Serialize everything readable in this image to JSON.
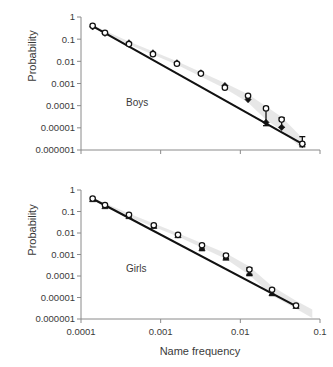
{
  "figure": {
    "x_axis_title": "Name frequency",
    "y_axis_title": "Probability"
  },
  "chart_data": [
    {
      "type": "scatter",
      "panel_id": "boys",
      "title": "",
      "annotation": "Boys",
      "xlabel": "Name frequency",
      "ylabel": "Probability",
      "xscale": "log",
      "yscale": "log",
      "xlim": [
        0.0001,
        0.1
      ],
      "ylim": [
        1e-06,
        1
      ],
      "xticks": [
        0.0001,
        0.001,
        0.01,
        0.1
      ],
      "xtick_labels": [
        "0.0001",
        "0.001",
        "0.01",
        "0.1"
      ],
      "yticks": [
        1,
        0.1,
        0.01,
        0.001,
        0.0001,
        1e-05,
        1e-06
      ],
      "ytick_labels": [
        "1",
        "0.1",
        "0.01",
        "0.001",
        "0.0001",
        "0.00001",
        "0.000001"
      ],
      "grid": false,
      "legend": "none",
      "series": [
        {
          "name": "observed-filled",
          "marker": "filled-diamond",
          "x": [
            0.00014,
            0.0002,
            0.0004,
            0.0008,
            0.0016,
            0.0032,
            0.0064,
            0.0125,
            0.021,
            0.033,
            0.06
          ],
          "y": [
            0.36,
            0.185,
            0.068,
            0.024,
            0.0085,
            0.003,
            0.0008,
            0.00019,
            1.75e-05,
            1.05e-05,
            1.8e-06
          ]
        },
        {
          "name": "predicted-open",
          "marker": "open-circle",
          "x": [
            0.00014,
            0.0002,
            0.0004,
            0.0008,
            0.0016,
            0.0032,
            0.0064,
            0.0125,
            0.021,
            0.033,
            0.06
          ],
          "y": [
            0.4,
            0.195,
            0.06,
            0.021,
            0.0078,
            0.0028,
            0.00065,
            0.00028,
            7.5e-05,
            2.35e-05,
            1.9e-06
          ]
        }
      ],
      "error_bars": [
        {
          "x": 0.021,
          "y": 7.5e-05,
          "lo": 1.25e-05,
          "hi": 9e-05
        },
        {
          "x": 0.033,
          "y": 2.35e-05,
          "lo": 1.05e-05,
          "hi": 2.9e-05
        },
        {
          "x": 0.06,
          "y": 1.9e-06,
          "lo": 1.4e-06,
          "hi": 4e-06
        }
      ],
      "band": {
        "x": [
          0.00014,
          0.0004,
          0.0016,
          0.0064,
          0.0125,
          0.021,
          0.033,
          0.06
        ],
        "lo": [
          0.33,
          0.058,
          0.007,
          0.0006,
          0.00014,
          2.3e-05,
          7.5e-06,
          1.1e-06
        ],
        "hi": [
          0.44,
          0.078,
          0.01,
          0.00105,
          0.00033,
          9.5e-05,
          3.1e-05,
          3.5e-06
        ]
      },
      "fit": {
        "x": [
          0.00014,
          0.06
        ],
        "y": [
          0.385,
          1.9e-06
        ]
      }
    },
    {
      "type": "scatter",
      "panel_id": "girls",
      "title": "",
      "annotation": "Girls",
      "xlabel": "Name frequency",
      "ylabel": "Probability",
      "xscale": "log",
      "yscale": "log",
      "xlim": [
        0.0001,
        0.1
      ],
      "ylim": [
        1e-06,
        1
      ],
      "xticks": [
        0.0001,
        0.001,
        0.01,
        0.1
      ],
      "xtick_labels": [
        "0.0001",
        "0.001",
        "0.01",
        "0.1"
      ],
      "yticks": [
        1,
        0.1,
        0.01,
        0.001,
        0.0001,
        1e-05,
        1e-06
      ],
      "ytick_labels": [
        "1",
        "0.1",
        "0.01",
        "0.001",
        "0.0001",
        "0.00001",
        "0.000001"
      ],
      "grid": false,
      "legend": "none",
      "series": [
        {
          "name": "observed-filled",
          "marker": "filled-triangle",
          "x": [
            0.00014,
            0.0002,
            0.0004,
            0.00082,
            0.00165,
            0.0033,
            0.0066,
            0.013,
            0.025,
            0.05
          ],
          "y": [
            0.37,
            0.175,
            0.06,
            0.021,
            0.0078,
            0.0019,
            0.0007,
            0.00013,
            1.55e-05,
            4e-06
          ]
        },
        {
          "name": "predicted-open",
          "marker": "open-circle",
          "x": [
            0.00014,
            0.0002,
            0.0004,
            0.00082,
            0.00165,
            0.0033,
            0.0066,
            0.013,
            0.025,
            0.05
          ],
          "y": [
            0.4,
            0.2,
            0.07,
            0.023,
            0.0082,
            0.0027,
            0.0009,
            0.0002,
            2.3e-05,
            4.2e-06
          ]
        }
      ],
      "error_bars": [
        {
          "x": 0.0033,
          "y": 0.0027,
          "lo": 0.0018,
          "hi": 0.0031
        },
        {
          "x": 0.0066,
          "y": 0.0009,
          "lo": 0.00065,
          "hi": 0.00105
        },
        {
          "x": 0.013,
          "y": 0.0002,
          "lo": 0.00012,
          "hi": 0.00024
        },
        {
          "x": 0.025,
          "y": 2.3e-05,
          "lo": 1.3e-05,
          "hi": 2.6e-05
        }
      ],
      "band": {
        "x": [
          0.00014,
          0.0004,
          0.00165,
          0.0066,
          0.013,
          0.025,
          0.05,
          0.08
        ],
        "lo": [
          0.33,
          0.055,
          0.0068,
          0.00062,
          0.00011,
          1.25e-05,
          3e-06,
          1.1e-06
        ],
        "hi": [
          0.44,
          0.08,
          0.0098,
          0.00115,
          0.00028,
          3.3e-05,
          7e-06,
          2.8e-06
        ]
      },
      "fit": {
        "x": [
          0.00014,
          0.05
        ],
        "y": [
          0.39,
          4e-06
        ]
      }
    }
  ]
}
